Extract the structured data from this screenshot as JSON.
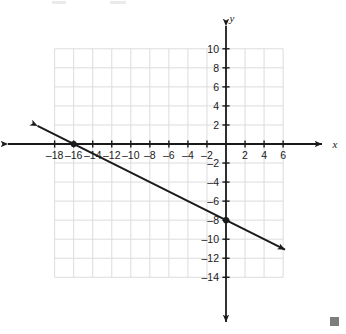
{
  "chart_data": {
    "type": "line",
    "title": "",
    "subtitle": "",
    "xlabel": "x",
    "ylabel": "y",
    "grid": true,
    "legend": "none",
    "xlim": [
      -19,
      7
    ],
    "ylim": [
      -15,
      11
    ],
    "x_ticks": [
      -18,
      -16,
      -14,
      -12,
      -10,
      -8,
      -6,
      -4,
      -2,
      2,
      4,
      6
    ],
    "y_ticks": [
      10,
      8,
      6,
      4,
      2,
      -2,
      -4,
      -6,
      -8,
      -10,
      -12,
      -14
    ],
    "x_tick_labels": [
      "–18",
      "–16",
      "–14",
      "–12",
      "–10",
      "–8",
      "–6",
      "–4",
      "–2",
      "2",
      "4",
      "6"
    ],
    "y_tick_labels": [
      "10",
      "8",
      "6",
      "4",
      "2",
      "–2",
      "–4",
      "–6",
      "–8",
      "–10",
      "–12",
      "–14"
    ],
    "x_tick_step": 2,
    "y_tick_step": 2,
    "grid_x_range": [
      -18,
      6
    ],
    "grid_y_range": [
      -14,
      10
    ],
    "series": [
      {
        "name": "line",
        "equation": "y = -0.5x - 8",
        "slope": -0.5,
        "y_intercept": -8,
        "x_intercept": -16,
        "draw_from": [
          -19.8,
          1.9
        ],
        "draw_to": [
          6.2,
          -11.1
        ],
        "arrow_both_ends": true,
        "color": "#1a1a1a",
        "points": [
          {
            "x": -16,
            "y": 0,
            "label": ""
          },
          {
            "x": 0,
            "y": -8,
            "label": ""
          }
        ]
      }
    ],
    "axis_colors": {
      "axis": "#1a1a1a",
      "grid": "#dcdce0",
      "plot_background": "#ffffff"
    }
  },
  "decorations": {
    "corner_marker_color": "#7d7d7d",
    "corner_marker_name": "resize-handle"
  }
}
